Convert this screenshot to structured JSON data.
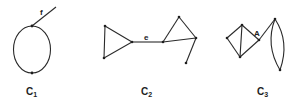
{
  "graphs": [
    {
      "id": "c1",
      "caption": "C",
      "caption_sub": "1",
      "edge_label": "f",
      "description": "cycle of two vertices (loop drawn as oval) with pendant edge f"
    },
    {
      "id": "c2",
      "caption": "C",
      "caption_sub": "2",
      "edge_label": "e",
      "description": "two triangles joined by bridge edge e, with a pendant vertex"
    },
    {
      "id": "c3",
      "caption": "C",
      "caption_sub": "3",
      "vertex_label": "A",
      "description": "diamond (K4 minus edge) joined at cut vertex A to a 2-cycle lens"
    }
  ],
  "colors": {
    "stroke": "#2a2a2a",
    "background": "#ffffff"
  }
}
